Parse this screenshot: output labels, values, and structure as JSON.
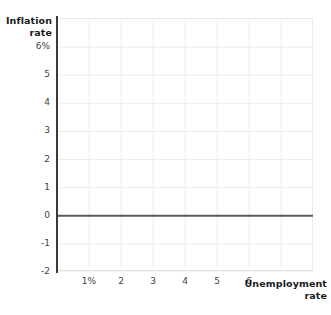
{
  "chart_data": {
    "type": "line",
    "title": "",
    "subtitle": "",
    "xlabel": "Unemployment rate",
    "ylabel": "Inflation rate",
    "grid": true,
    "legend": null,
    "series": [
      {
        "name": "zero-inflation-line",
        "type": "line",
        "color": "#5a5a5a",
        "x": [
          0.0,
          8.0
        ],
        "values": [
          0,
          0
        ]
      }
    ],
    "xlim": [
      0.0,
      8.0
    ],
    "ylim": [
      -2,
      7
    ],
    "x_ticks": [
      1,
      2,
      3,
      4,
      5,
      6
    ],
    "x_tick_labels": [
      "1%",
      "2",
      "3",
      "4",
      "5",
      "6"
    ],
    "y_ticks": [
      6,
      5,
      4,
      3,
      2,
      1,
      0,
      -1,
      -2
    ],
    "y_tick_labels": [
      "6%",
      "5",
      "4",
      "3",
      "2",
      "1",
      "0",
      "-1",
      "-2"
    ],
    "x_gridlines": [
      1,
      2,
      3,
      4,
      5,
      6,
      7,
      8
    ],
    "y_gridlines": [
      6,
      5,
      4,
      3,
      2,
      1,
      0,
      -1,
      -2
    ],
    "annotations": [],
    "data_points": [],
    "colors": {
      "grid": "#ececec",
      "axis": "#3a3a3a",
      "zero_line": "#5a5a5a",
      "text": "#3f3f3f",
      "title_text": "#1a1a1a",
      "background": "#ffffff"
    }
  },
  "axes": {
    "y_title_line1": "Inflation",
    "y_title_line2": "rate",
    "x_title_line1": "Unemployment",
    "x_title_line2": "rate"
  }
}
